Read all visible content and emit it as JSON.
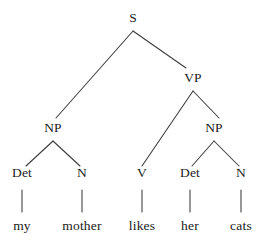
{
  "figure": {
    "type": "syntax-tree",
    "title": "",
    "background_color": "#ffffff",
    "line_color": "#3a3a3a",
    "text_color": "#1a1a1a"
  },
  "sentence": "my mother likes her cats",
  "nodes": {
    "s": {
      "label": "S",
      "x": 133,
      "y": 18
    },
    "np_subject": {
      "label": "NP",
      "x": 53,
      "y": 128
    },
    "vp": {
      "label": "VP",
      "x": 193,
      "y": 78
    },
    "np_object": {
      "label": "NP",
      "x": 214,
      "y": 128
    },
    "det_1": {
      "label": "Det",
      "x": 22,
      "y": 173
    },
    "n_1": {
      "label": "N",
      "x": 82,
      "y": 173
    },
    "v_1": {
      "label": "V",
      "x": 142,
      "y": 173
    },
    "det_2": {
      "label": "Det",
      "x": 190,
      "y": 173
    },
    "n_2": {
      "label": "N",
      "x": 241,
      "y": 173
    }
  },
  "words": {
    "w1": {
      "label": "my",
      "x": 22,
      "y": 226
    },
    "w2": {
      "label": "mother",
      "x": 82,
      "y": 226
    },
    "w3": {
      "label": "likes",
      "x": 142,
      "y": 226
    },
    "w4": {
      "label": "her",
      "x": 190,
      "y": 226
    },
    "w5": {
      "label": "cats",
      "x": 241,
      "y": 226
    }
  },
  "edges": [
    {
      "name": "s-to-np-subject",
      "from": "S",
      "to": "NP",
      "x1": 133,
      "y1": 31,
      "x2": 56,
      "y2": 118
    },
    {
      "name": "s-to-vp",
      "from": "S",
      "to": "VP",
      "x1": 133,
      "y1": 31,
      "x2": 186,
      "y2": 68
    },
    {
      "name": "vp-to-v",
      "from": "VP",
      "to": "V",
      "x1": 193,
      "y1": 91,
      "x2": 142,
      "y2": 166
    },
    {
      "name": "vp-to-np-object",
      "from": "VP",
      "to": "NP",
      "x1": 193,
      "y1": 91,
      "x2": 219,
      "y2": 118
    },
    {
      "name": "np-subject-to-det",
      "from": "NP",
      "to": "Det",
      "x1": 53,
      "y1": 141,
      "x2": 26,
      "y2": 166
    },
    {
      "name": "np-subject-to-n",
      "from": "NP",
      "to": "N",
      "x1": 53,
      "y1": 141,
      "x2": 80,
      "y2": 166
    },
    {
      "name": "np-object-to-det",
      "from": "NP",
      "to": "Det",
      "x1": 214,
      "y1": 141,
      "x2": 192,
      "y2": 166
    },
    {
      "name": "np-object-to-n",
      "from": "NP",
      "to": "N",
      "x1": 214,
      "y1": 141,
      "x2": 239,
      "y2": 166
    }
  ],
  "stems": [
    {
      "name": "det-to-my",
      "x": 22,
      "y1": 190,
      "y2": 212
    },
    {
      "name": "n-to-mother",
      "x": 82,
      "y1": 190,
      "y2": 212
    },
    {
      "name": "v-to-likes",
      "x": 142,
      "y1": 190,
      "y2": 212
    },
    {
      "name": "det-to-her",
      "x": 190,
      "y1": 190,
      "y2": 212
    },
    {
      "name": "n-to-cats",
      "x": 241,
      "y1": 190,
      "y2": 212
    }
  ]
}
